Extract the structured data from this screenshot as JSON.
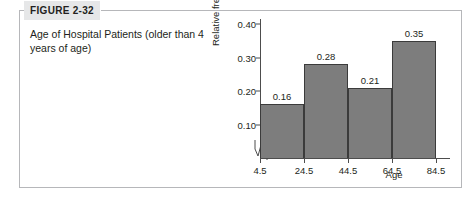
{
  "figure": {
    "tag_label": "FIGURE 2-32",
    "caption": "Age of Hospital Patients (older than 4 years of age)"
  },
  "colors": {
    "bar_fill": "#7d7d7d",
    "bar_edge": "#3b3b3b",
    "axis": "#4d4d4d",
    "frame": "#b6b7ba",
    "tag_background": "#e6e7e8",
    "text": "#231f20"
  },
  "chart_data": {
    "type": "bar",
    "title": "",
    "subtitle": "",
    "xlabel": "Age",
    "ylabel": "Relative frequency",
    "categories": [
      "4.5-24.5",
      "24.5-44.5",
      "44.5-64.5",
      "64.5-84.5"
    ],
    "values": [
      0.16,
      0.28,
      0.21,
      0.35
    ],
    "data_labels": [
      "0.16",
      "0.28",
      "0.21",
      "0.35"
    ],
    "bin_edges": [
      4.5,
      24.5,
      44.5,
      64.5,
      84.5
    ],
    "x_tick_labels": [
      "4.5",
      "24.5",
      "44.5",
      "64.5",
      "84.5"
    ],
    "y_tick_labels": [
      "0.40",
      "0.30",
      "0.20",
      "0.10"
    ],
    "y_ticks": [
      0.4,
      0.3,
      0.2,
      0.1
    ],
    "ylim": [
      0.0,
      0.4
    ],
    "xlim": [
      4.5,
      84.5
    ],
    "grid": false,
    "legend": "none",
    "axis_break": "x-axis zigzag break near origin"
  }
}
